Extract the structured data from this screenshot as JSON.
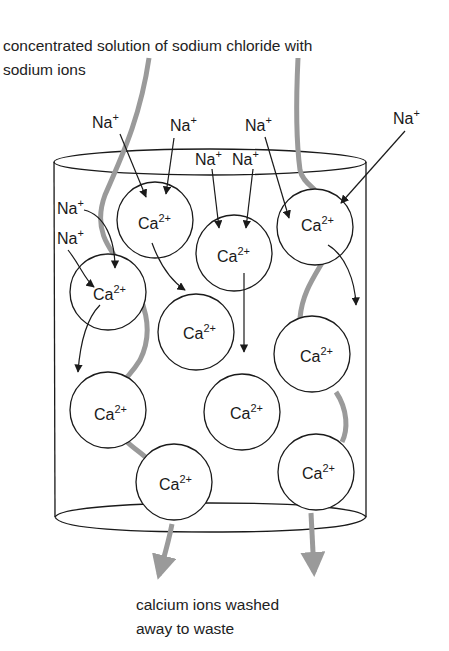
{
  "diagram": {
    "top_caption": {
      "line1": "concentrated solution of sodium chloride with",
      "line2": "sodium ions"
    },
    "bottom_caption": {
      "line1": "calcium ions washed",
      "line2": "away to waste"
    },
    "sodium_ion": {
      "symbol": "Na",
      "charge": "+"
    },
    "calcium_ion": {
      "symbol": "Ca",
      "charge": "2+"
    },
    "sodium_labels_count": 8,
    "calcium_beads_count": 11,
    "colors": {
      "line": "#1a1a1a",
      "flow_path": "#9a9a9a",
      "background": "#ffffff"
    }
  }
}
